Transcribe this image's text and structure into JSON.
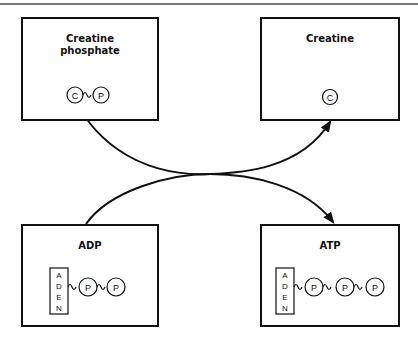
{
  "diagram": {
    "boxes": [
      {
        "id": "creatine-phosphate",
        "title_line1": "Creatine",
        "title_line2": "phosphate",
        "molecule": [
          "C",
          "P"
        ]
      },
      {
        "id": "creatine",
        "title": "Creatine",
        "molecule": [
          "C"
        ]
      },
      {
        "id": "adp",
        "title": "ADP",
        "base_letters": [
          "A",
          "D",
          "E",
          "N"
        ],
        "phosphates": [
          "P",
          "P"
        ]
      },
      {
        "id": "atp",
        "title": "ATP",
        "base_letters": [
          "A",
          "D",
          "E",
          "N"
        ],
        "phosphates": [
          "P",
          "P",
          "P"
        ]
      }
    ],
    "arrows": [
      {
        "from": "creatine-phosphate",
        "to": "creatine"
      },
      {
        "from": "adp",
        "to": "atp"
      }
    ],
    "colors": {
      "stroke": "#111111",
      "rule": "#7a7a7a",
      "background": "#ffffff"
    }
  }
}
